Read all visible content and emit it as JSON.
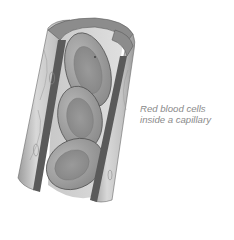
{
  "diagram": {
    "caption": {
      "line1": "Red blood cells",
      "line2": "inside a capillary"
    },
    "parts": [
      {
        "name": "capillary-wall",
        "description": "cutaway cylindrical tube"
      },
      {
        "name": "red-blood-cell",
        "count": 3
      }
    ],
    "colors": {
      "wall_light": "#d6d6d6",
      "wall_mid": "#a8a8a8",
      "wall_dark": "#5a5a5a",
      "cell_fill": "#9a9a9a",
      "cell_center": "#8a8a8a",
      "caption": "#8a8a8a"
    }
  }
}
